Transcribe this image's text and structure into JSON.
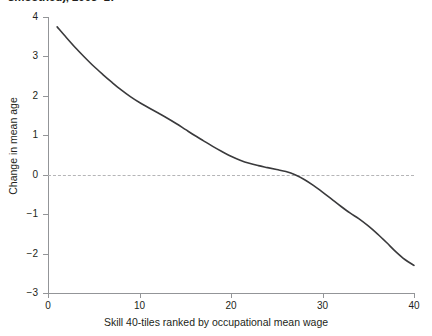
{
  "chart_data": {
    "type": "line",
    "title": "smoothed), 2003–17",
    "xlabel": "Skill 40-tiles ranked by occupational mean wage",
    "ylabel": "Change in mean age",
    "xlim": [
      0,
      40
    ],
    "ylim": [
      -3,
      4
    ],
    "xticks": [
      0,
      10,
      20,
      30,
      40
    ],
    "yticks": [
      4,
      3,
      2,
      1,
      0,
      -1,
      -2,
      -3
    ],
    "grid": false,
    "legend": null,
    "reference_lines": [
      {
        "axis": "y",
        "value": 0,
        "style": "dashed",
        "color": "#b5b5b7"
      }
    ],
    "series": [
      {
        "name": "Change in mean age",
        "color": "#3a3a3c",
        "x": [
          1,
          2,
          3,
          4,
          5,
          6,
          7,
          8,
          9,
          10,
          11,
          12,
          13,
          14,
          15,
          16,
          17,
          18,
          19,
          20,
          21,
          22,
          23,
          24,
          25,
          26,
          27,
          28,
          29,
          30,
          31,
          32,
          33,
          34,
          35,
          36,
          37,
          38,
          39,
          40
        ],
        "values": [
          3.75,
          3.48,
          3.22,
          2.98,
          2.75,
          2.54,
          2.34,
          2.15,
          1.98,
          1.83,
          1.7,
          1.57,
          1.44,
          1.3,
          1.15,
          1.0,
          0.86,
          0.72,
          0.59,
          0.47,
          0.37,
          0.29,
          0.23,
          0.18,
          0.13,
          0.08,
          0.0,
          -0.12,
          -0.27,
          -0.44,
          -0.62,
          -0.8,
          -0.97,
          -1.12,
          -1.3,
          -1.5,
          -1.72,
          -1.95,
          -2.15,
          -2.3
        ]
      }
    ]
  },
  "axes": {
    "y_tick_labels": [
      "4",
      "3",
      "2",
      "1",
      "0",
      "−1",
      "−2",
      "−3"
    ],
    "x_tick_labels": [
      "0",
      "10",
      "20",
      "30",
      "40"
    ]
  }
}
